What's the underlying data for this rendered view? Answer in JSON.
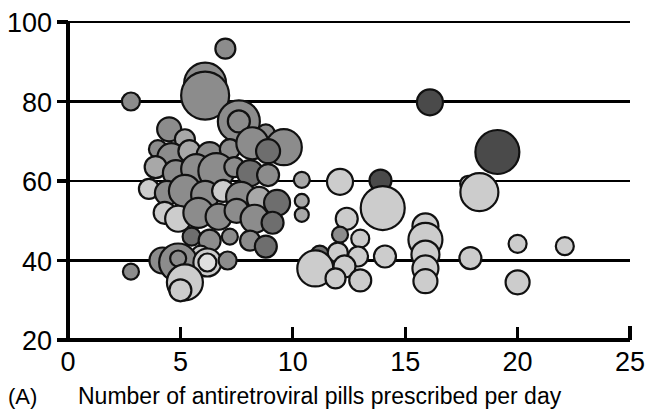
{
  "figure": {
    "panel_label": "(A)",
    "xaxis_title": "Number of antiretroviral pills prescribed per day"
  },
  "chart_data": {
    "type": "scatter",
    "subtype": "bubble",
    "title": "",
    "subtitle": "",
    "panel_label": "(A)",
    "xlabel": "Number of antiretroviral pills prescribed per day",
    "ylabel": "",
    "xlim": [
      0,
      25
    ],
    "ylim": [
      20,
      100
    ],
    "xticks": [
      0,
      5,
      10,
      15,
      20,
      25
    ],
    "yticks": [
      20,
      40,
      60,
      80,
      100
    ],
    "xtick_labels": [
      "0",
      "5",
      "10",
      "15",
      "20",
      "25"
    ],
    "ytick_labels": [
      "20",
      "40",
      "60",
      "80",
      "100"
    ],
    "grid": "horizontal",
    "gridlines_y": [
      40,
      60,
      80,
      100
    ],
    "legend": "none",
    "marker_outline_color": "#111111",
    "fill_palette": {
      "dark": "#4a4a4a",
      "medium_dark": "#6e6e6e",
      "medium": "#8c8c8c",
      "medium_light": "#a8a8a8",
      "light": "#cccccc",
      "very_light": "#e0e0e0"
    },
    "size_encoding": "bubble area proportional to group size",
    "points": [
      {
        "x": 2.8,
        "y": 80.0,
        "r": 9,
        "fill": "#8c8c8c"
      },
      {
        "x": 2.8,
        "y": 37.2,
        "r": 8,
        "fill": "#8c8c8c"
      },
      {
        "x": 7.0,
        "y": 93.3,
        "r": 10,
        "fill": "#8c8c8c"
      },
      {
        "x": 6.1,
        "y": 84.5,
        "r": 21,
        "fill": "#8c8c8c"
      },
      {
        "x": 6.1,
        "y": 81.5,
        "r": 24,
        "fill": "#8c8c8c"
      },
      {
        "x": 16.1,
        "y": 79.8,
        "r": 13,
        "fill": "#4a4a4a"
      },
      {
        "x": 4.5,
        "y": 73.0,
        "r": 12,
        "fill": "#8c8c8c"
      },
      {
        "x": 5.2,
        "y": 70.5,
        "r": 10,
        "fill": "#a8a8a8"
      },
      {
        "x": 7.6,
        "y": 75.0,
        "r": 21,
        "fill": "#8c8c8c"
      },
      {
        "x": 7.6,
        "y": 75.0,
        "r": 11,
        "fill": "#8c8c8c"
      },
      {
        "x": 8.8,
        "y": 72.0,
        "r": 9,
        "fill": "#8c8c8c"
      },
      {
        "x": 9.6,
        "y": 68.5,
        "r": 18,
        "fill": "#8c8c8c"
      },
      {
        "x": 4.0,
        "y": 68.0,
        "r": 9,
        "fill": "#8c8c8c"
      },
      {
        "x": 4.6,
        "y": 66.0,
        "r": 14,
        "fill": "#8c8c8c"
      },
      {
        "x": 5.4,
        "y": 67.5,
        "r": 11,
        "fill": "#a8a8a8"
      },
      {
        "x": 6.3,
        "y": 66.5,
        "r": 13,
        "fill": "#8c8c8c"
      },
      {
        "x": 7.2,
        "y": 68.0,
        "r": 10,
        "fill": "#8c8c8c"
      },
      {
        "x": 8.2,
        "y": 69.5,
        "r": 16,
        "fill": "#8c8c8c"
      },
      {
        "x": 8.9,
        "y": 67.5,
        "r": 12,
        "fill": "#6e6e6e"
      },
      {
        "x": 19.1,
        "y": 67.3,
        "r": 22,
        "fill": "#4a4a4a"
      },
      {
        "x": 3.9,
        "y": 63.5,
        "r": 11,
        "fill": "#a8a8a8"
      },
      {
        "x": 4.8,
        "y": 62.0,
        "r": 13,
        "fill": "#8c8c8c"
      },
      {
        "x": 5.7,
        "y": 63.0,
        "r": 15,
        "fill": "#8c8c8c"
      },
      {
        "x": 6.6,
        "y": 62.5,
        "r": 18,
        "fill": "#8c8c8c"
      },
      {
        "x": 7.4,
        "y": 63.5,
        "r": 10,
        "fill": "#8c8c8c"
      },
      {
        "x": 8.1,
        "y": 62.0,
        "r": 13,
        "fill": "#6e6e6e"
      },
      {
        "x": 8.9,
        "y": 61.5,
        "r": 11,
        "fill": "#8c8c8c"
      },
      {
        "x": 10.4,
        "y": 60.3,
        "r": 8,
        "fill": "#a8a8a8"
      },
      {
        "x": 12.1,
        "y": 59.8,
        "r": 13,
        "fill": "#cccccc"
      },
      {
        "x": 13.9,
        "y": 60.1,
        "r": 11,
        "fill": "#4a4a4a"
      },
      {
        "x": 17.8,
        "y": 59.3,
        "r": 8,
        "fill": "#cccccc"
      },
      {
        "x": 18.3,
        "y": 57.2,
        "r": 19,
        "fill": "#cccccc"
      },
      {
        "x": 3.6,
        "y": 58.0,
        "r": 10,
        "fill": "#cccccc"
      },
      {
        "x": 4.4,
        "y": 57.0,
        "r": 12,
        "fill": "#8c8c8c"
      },
      {
        "x": 5.2,
        "y": 57.5,
        "r": 16,
        "fill": "#8c8c8c"
      },
      {
        "x": 6.1,
        "y": 56.5,
        "r": 14,
        "fill": "#8c8c8c"
      },
      {
        "x": 6.9,
        "y": 57.5,
        "r": 11,
        "fill": "#cccccc"
      },
      {
        "x": 7.7,
        "y": 56.0,
        "r": 15,
        "fill": "#8c8c8c"
      },
      {
        "x": 8.5,
        "y": 55.5,
        "r": 12,
        "fill": "#a8a8a8"
      },
      {
        "x": 9.3,
        "y": 54.5,
        "r": 13,
        "fill": "#6e6e6e"
      },
      {
        "x": 10.4,
        "y": 55.0,
        "r": 7,
        "fill": "#a8a8a8"
      },
      {
        "x": 10.4,
        "y": 51.5,
        "r": 7,
        "fill": "#a8a8a8"
      },
      {
        "x": 14.0,
        "y": 53.2,
        "r": 22,
        "fill": "#cccccc"
      },
      {
        "x": 12.4,
        "y": 50.5,
        "r": 11,
        "fill": "#cccccc"
      },
      {
        "x": 4.3,
        "y": 52.0,
        "r": 11,
        "fill": "#cccccc"
      },
      {
        "x": 4.9,
        "y": 50.5,
        "r": 13,
        "fill": "#cccccc"
      },
      {
        "x": 5.8,
        "y": 52.0,
        "r": 15,
        "fill": "#8c8c8c"
      },
      {
        "x": 6.7,
        "y": 51.0,
        "r": 13,
        "fill": "#8c8c8c"
      },
      {
        "x": 7.5,
        "y": 52.5,
        "r": 12,
        "fill": "#8c8c8c"
      },
      {
        "x": 8.3,
        "y": 50.5,
        "r": 14,
        "fill": "#8c8c8c"
      },
      {
        "x": 9.1,
        "y": 49.5,
        "r": 11,
        "fill": "#6e6e6e"
      },
      {
        "x": 15.9,
        "y": 48.6,
        "r": 13,
        "fill": "#cccccc"
      },
      {
        "x": 15.9,
        "y": 45.2,
        "r": 17,
        "fill": "#cccccc"
      },
      {
        "x": 12.1,
        "y": 46.5,
        "r": 8,
        "fill": "#8c8c8c"
      },
      {
        "x": 13.0,
        "y": 45.5,
        "r": 9,
        "fill": "#cccccc"
      },
      {
        "x": 20.0,
        "y": 44.2,
        "r": 9,
        "fill": "#cccccc"
      },
      {
        "x": 22.1,
        "y": 43.6,
        "r": 9,
        "fill": "#cccccc"
      },
      {
        "x": 5.5,
        "y": 46.0,
        "r": 9,
        "fill": "#6e6e6e"
      },
      {
        "x": 6.3,
        "y": 45.0,
        "r": 11,
        "fill": "#8c8c8c"
      },
      {
        "x": 7.2,
        "y": 46.0,
        "r": 8,
        "fill": "#8c8c8c"
      },
      {
        "x": 8.1,
        "y": 45.0,
        "r": 10,
        "fill": "#8c8c8c"
      },
      {
        "x": 8.8,
        "y": 43.5,
        "r": 11,
        "fill": "#6e6e6e"
      },
      {
        "x": 5.9,
        "y": 41.5,
        "r": 9,
        "fill": "#cccccc"
      },
      {
        "x": 11.2,
        "y": 41.5,
        "r": 9,
        "fill": "#6e6e6e"
      },
      {
        "x": 12.0,
        "y": 42.0,
        "r": 10,
        "fill": "#cccccc"
      },
      {
        "x": 12.9,
        "y": 41.0,
        "r": 10,
        "fill": "#cccccc"
      },
      {
        "x": 14.1,
        "y": 41.0,
        "r": 11,
        "fill": "#cccccc"
      },
      {
        "x": 15.9,
        "y": 41.5,
        "r": 14,
        "fill": "#cccccc"
      },
      {
        "x": 17.9,
        "y": 40.6,
        "r": 11,
        "fill": "#cccccc"
      },
      {
        "x": 4.2,
        "y": 40.0,
        "r": 13,
        "fill": "#8c8c8c"
      },
      {
        "x": 4.9,
        "y": 39.5,
        "r": 19,
        "fill": "#8c8c8c"
      },
      {
        "x": 4.9,
        "y": 40.5,
        "r": 8,
        "fill": "#8c8c8c"
      },
      {
        "x": 6.2,
        "y": 39.5,
        "r": 14,
        "fill": "#cccccc"
      },
      {
        "x": 6.2,
        "y": 39.5,
        "r": 9,
        "fill": "#e0e0e0"
      },
      {
        "x": 7.1,
        "y": 40.0,
        "r": 9,
        "fill": "#8c8c8c"
      },
      {
        "x": 11.0,
        "y": 38.0,
        "r": 18,
        "fill": "#cccccc"
      },
      {
        "x": 12.3,
        "y": 38.5,
        "r": 11,
        "fill": "#cccccc"
      },
      {
        "x": 15.9,
        "y": 38.0,
        "r": 13,
        "fill": "#cccccc"
      },
      {
        "x": 11.9,
        "y": 35.5,
        "r": 10,
        "fill": "#cccccc"
      },
      {
        "x": 13.0,
        "y": 35.0,
        "r": 11,
        "fill": "#cccccc"
      },
      {
        "x": 15.9,
        "y": 34.8,
        "r": 12,
        "fill": "#cccccc"
      },
      {
        "x": 20.0,
        "y": 34.5,
        "r": 12,
        "fill": "#cccccc"
      },
      {
        "x": 5.2,
        "y": 34.5,
        "r": 18,
        "fill": "#cccccc"
      },
      {
        "x": 5.0,
        "y": 32.5,
        "r": 11,
        "fill": "#cccccc"
      }
    ]
  }
}
